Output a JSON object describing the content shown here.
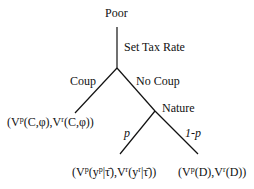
{
  "diagram": {
    "type": "game-tree",
    "root": {
      "label": "Poor"
    },
    "edges": {
      "root_action": "Set Tax Rate",
      "coup": "Coup",
      "no_coup": "No Coup",
      "p": "p",
      "one_minus_p": "1-p"
    },
    "chance_node": {
      "label": "Nature"
    },
    "payoffs": {
      "coup": {
        "open": "(V",
        "s1": "p",
        "m1": "(C,φ),V",
        "s2": "r",
        "close": "(C,φ))"
      },
      "p_branch": {
        "open": "(V",
        "s1": "p",
        "m1": "(y",
        "s2": "p",
        "m2": "|τ̄),V",
        "s3": "r",
        "m3": "(y",
        "s4": "r",
        "close": "|τ̄))"
      },
      "one_minus_p_branch": {
        "open": "(V",
        "s1": "p",
        "m1": "(D),V",
        "s2": "r",
        "close": "(D))"
      }
    },
    "line_color": "#111111"
  }
}
